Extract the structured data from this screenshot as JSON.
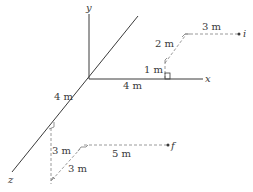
{
  "axes": {
    "x_label": "x",
    "y_label": "y",
    "z_label": "z"
  },
  "initial_path": {
    "point_label": "i",
    "segments": [
      {
        "label": "1 m",
        "direction": "+y"
      },
      {
        "label": "2 m",
        "direction": "-z"
      },
      {
        "label": "3 m",
        "direction": "+x"
      }
    ],
    "offset_label": "4 m"
  },
  "final_path": {
    "point_label": "f",
    "segments": [
      {
        "label": "3 m",
        "direction": "-y"
      },
      {
        "label": "3 m",
        "direction": "-z"
      },
      {
        "label": "5 m",
        "direction": "+x"
      }
    ],
    "offset_label": "4 m"
  },
  "colors": {
    "axis": "#3a3a3a",
    "dashed": "#9a9a9a"
  }
}
